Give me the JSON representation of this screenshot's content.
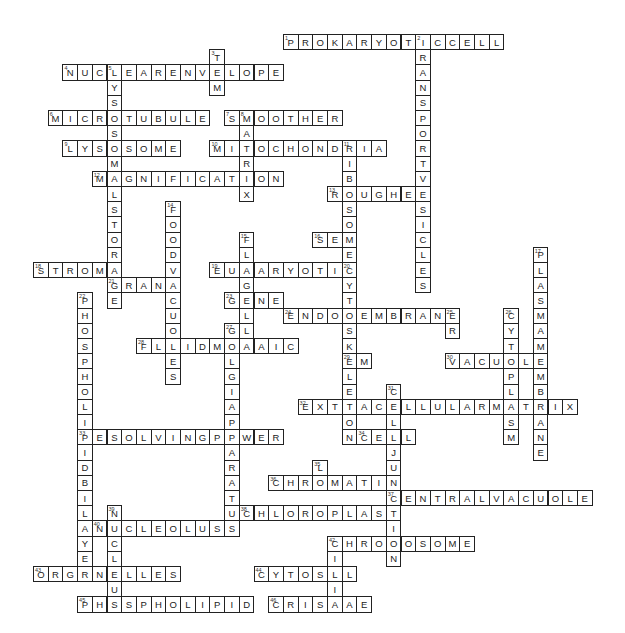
{
  "puzzle": {
    "type": "crossword",
    "grid": {
      "origin_x": 33,
      "origin_y": 34,
      "cell_w": 14.7,
      "cell_h": 15.2
    },
    "words": [
      {
        "num": 1,
        "dir": "across",
        "row": 0,
        "col": 17,
        "answer": "PROKARYOTICCELL"
      },
      {
        "num": 2,
        "dir": "down",
        "row": 0,
        "col": 26,
        "answer": "TRANSPORTVESICLES"
      },
      {
        "num": 3,
        "dir": "down",
        "row": 1,
        "col": 12,
        "answer": "TEM"
      },
      {
        "num": 4,
        "dir": "across",
        "row": 2,
        "col": 2,
        "answer": "NUCLEARENVELOPE"
      },
      {
        "num": 5,
        "dir": "down",
        "row": 2,
        "col": 5,
        "answer": "LYSOSOMALSTORAGE"
      },
      {
        "num": 6,
        "dir": "across",
        "row": 5,
        "col": 1,
        "answer": "MICROTUBULE"
      },
      {
        "num": 7,
        "dir": "across",
        "row": 5,
        "col": 13,
        "answer": "SMOOTHER"
      },
      {
        "num": 8,
        "dir": "down",
        "row": 5,
        "col": 14,
        "answer": "MATRIX"
      },
      {
        "num": 9,
        "dir": "across",
        "row": 7,
        "col": 2,
        "answer": "LYSOSOME"
      },
      {
        "num": 10,
        "dir": "across",
        "row": 7,
        "col": 12,
        "answer": "MITOCHONDRIA"
      },
      {
        "num": 11,
        "dir": "down",
        "row": 7,
        "col": 21,
        "answer": "RIBOSOME"
      },
      {
        "num": 12,
        "dir": "across",
        "row": 9,
        "col": 4,
        "answer": "MAGNIFICATION"
      },
      {
        "num": 13,
        "dir": "across",
        "row": 10,
        "col": 20,
        "answer": "ROUGHER"
      },
      {
        "num": 14,
        "dir": "down",
        "row": 11,
        "col": 9,
        "answer": "FOODVACUOLES"
      },
      {
        "num": 15,
        "dir": "down",
        "row": 13,
        "col": 14,
        "answer": "FLAGELLA"
      },
      {
        "num": 16,
        "dir": "across",
        "row": 13,
        "col": 19,
        "answer": "SEM"
      },
      {
        "num": 17,
        "dir": "down",
        "row": 14,
        "col": 34,
        "answer": "PLASMAMEMBRANE"
      },
      {
        "num": 18,
        "dir": "across",
        "row": 15,
        "col": 0,
        "answer": "STROMA"
      },
      {
        "num": 19,
        "dir": "across",
        "row": 15,
        "col": 12,
        "answer": "EUKARYOTIC"
      },
      {
        "num": 20,
        "dir": "down",
        "row": 15,
        "col": 21,
        "answer": "CYTOSKELETON"
      },
      {
        "num": 21,
        "dir": "across",
        "row": 16,
        "col": 5,
        "answer": "GRANA"
      },
      {
        "num": 22,
        "dir": "down",
        "row": 17,
        "col": 3,
        "answer": "PHOSPHOLIPIDBILAYER"
      },
      {
        "num": 23,
        "dir": "across",
        "row": 17,
        "col": 13,
        "answer": "GENE"
      },
      {
        "num": 24,
        "dir": "across",
        "row": 18,
        "col": 17,
        "answer": "ENDOMEMBRANE"
      },
      {
        "num": 25,
        "dir": "down",
        "row": 18,
        "col": 28,
        "answer": "ER"
      },
      {
        "num": 26,
        "dir": "down",
        "row": 18,
        "col": 32,
        "answer": "CYTOPLASM"
      },
      {
        "num": 27,
        "dir": "down",
        "row": 19,
        "col": 13,
        "answer": "GOLGIAPPARATUS"
      },
      {
        "num": 28,
        "dir": "across",
        "row": 20,
        "col": 7,
        "answer": "FLUIDMOSAIC"
      },
      {
        "num": 29,
        "dir": "across",
        "row": 21,
        "col": 21,
        "answer": "EM"
      },
      {
        "num": 30,
        "dir": "across",
        "row": 21,
        "col": 28,
        "answer": "VACUOLE"
      },
      {
        "num": 31,
        "dir": "down",
        "row": 23,
        "col": 24,
        "answer": "CELLJUNCTION"
      },
      {
        "num": 32,
        "dir": "across",
        "row": 24,
        "col": 18,
        "answer": "EXTRACELLULARMATRIX"
      },
      {
        "num": 33,
        "dir": "across",
        "row": 26,
        "col": 3,
        "answer": "RESOLVINGPOWER"
      },
      {
        "num": 34,
        "dir": "across",
        "row": 26,
        "col": 22,
        "answer": "CELL"
      },
      {
        "num": 35,
        "dir": "down",
        "row": 28,
        "col": 19,
        "answer": "L"
      },
      {
        "num": 36,
        "dir": "across",
        "row": 29,
        "col": 16,
        "answer": "CHROMATIN"
      },
      {
        "num": 37,
        "dir": "across",
        "row": 30,
        "col": 24,
        "answer": "CENTRALVACUOLE"
      },
      {
        "num": 38,
        "dir": "across",
        "row": 31,
        "col": 14,
        "answer": "CHLOROPLAST"
      },
      {
        "num": 39,
        "dir": "down",
        "row": 31,
        "col": 5,
        "answer": "NUCLEUS"
      },
      {
        "num": 40,
        "dir": "across",
        "row": 32,
        "col": 4,
        "answer": "NUCLEOLUS"
      },
      {
        "num": 41,
        "dir": "across",
        "row": 33,
        "col": 20,
        "answer": "CHROMOSOME"
      },
      {
        "num": 42,
        "dir": "down",
        "row": 33,
        "col": 20,
        "answer": "CILIA"
      },
      {
        "num": 43,
        "dir": "across",
        "row": 35,
        "col": 0,
        "answer": "ORGANELLES"
      },
      {
        "num": 44,
        "dir": "across",
        "row": 35,
        "col": 15,
        "answer": "CYTOSOL"
      },
      {
        "num": 45,
        "dir": "across",
        "row": 37,
        "col": 3,
        "answer": "PHOSPHOLIPID"
      },
      {
        "num": 46,
        "dir": "across",
        "row": 37,
        "col": 16,
        "answer": "CRISTAE"
      }
    ]
  }
}
